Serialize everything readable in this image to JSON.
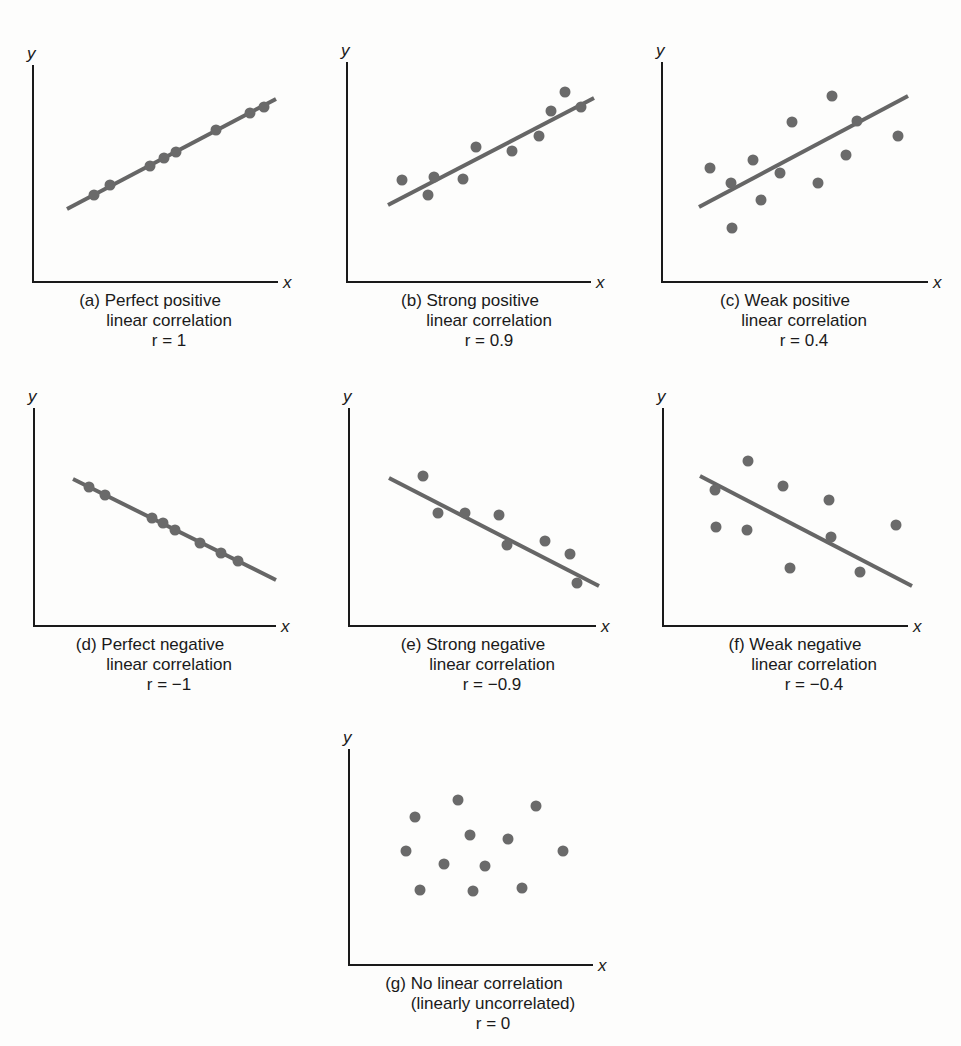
{
  "figure": {
    "axis_labels": {
      "x": "x",
      "y": "y"
    }
  },
  "colors": {
    "axis": "#1a1a1a",
    "fit_line": "#666666",
    "point": "#6a6a6a",
    "background": "#fdfdfc"
  },
  "chart_data": [
    {
      "id": "a",
      "type": "scatter",
      "label": "(a)",
      "caption": [
        "Perfect positive",
        "linear correlation"
      ],
      "r_text": "r = 1",
      "r": 1,
      "xlabel": "x",
      "ylabel": "y",
      "frame": {
        "x0": 33,
        "ytop": 65,
        "ybase": 282,
        "xend": 278
      },
      "fit_line": [
        [
          67,
          209
        ],
        [
          276,
          99
        ]
      ],
      "points": [
        [
          94,
          195
        ],
        [
          110,
          185
        ],
        [
          150,
          166
        ],
        [
          164,
          158
        ],
        [
          176,
          152
        ],
        [
          216,
          130
        ],
        [
          250,
          113
        ],
        [
          264,
          107
        ]
      ],
      "caption_x": 155
    },
    {
      "id": "b",
      "type": "scatter",
      "label": "(b)",
      "caption": [
        "Strong positive",
        "linear correlation"
      ],
      "r_text": "r = 0.9",
      "r": 0.9,
      "xlabel": "x",
      "ylabel": "y",
      "frame": {
        "x0": 347,
        "ytop": 62,
        "ybase": 282,
        "xend": 591
      },
      "fit_line": [
        [
          388,
          205
        ],
        [
          594,
          98
        ]
      ],
      "points": [
        [
          402,
          180
        ],
        [
          428,
          195
        ],
        [
          434,
          177
        ],
        [
          463,
          179
        ],
        [
          476,
          147
        ],
        [
          512,
          151
        ],
        [
          539,
          136
        ],
        [
          551,
          111
        ],
        [
          565,
          92
        ],
        [
          581,
          107
        ]
      ],
      "caption_x": 475
    },
    {
      "id": "c",
      "type": "scatter",
      "label": "(c)",
      "caption": [
        "Weak positive",
        "linear correlation"
      ],
      "r_text": "r = 0.4",
      "r": 0.4,
      "xlabel": "x",
      "ylabel": "y",
      "frame": {
        "x0": 662,
        "ytop": 62,
        "ybase": 282,
        "xend": 928
      },
      "fit_line": [
        [
          699,
          207
        ],
        [
          908,
          96
        ]
      ],
      "points": [
        [
          710,
          168
        ],
        [
          731,
          183
        ],
        [
          732,
          228
        ],
        [
          753,
          160
        ],
        [
          761,
          200
        ],
        [
          780,
          173
        ],
        [
          792,
          122
        ],
        [
          818,
          183
        ],
        [
          832,
          96
        ],
        [
          846,
          155
        ],
        [
          857,
          121
        ],
        [
          898,
          136
        ]
      ],
      "caption_x": 790
    },
    {
      "id": "d",
      "type": "scatter",
      "label": "(d)",
      "caption": [
        "Perfect negative",
        "linear correlation"
      ],
      "r_text": "r = −1",
      "r": -1,
      "xlabel": "x",
      "ylabel": "y",
      "frame": {
        "x0": 34,
        "ytop": 408,
        "ybase": 626,
        "xend": 276
      },
      "fit_line": [
        [
          73,
          479
        ],
        [
          276,
          580
        ]
      ],
      "points": [
        [
          89,
          487
        ],
        [
          105,
          495
        ],
        [
          152,
          518
        ],
        [
          163,
          523
        ],
        [
          175,
          530
        ],
        [
          200,
          543
        ],
        [
          221,
          553
        ],
        [
          238,
          561
        ]
      ],
      "caption_x": 155
    },
    {
      "id": "e",
      "type": "scatter",
      "label": "(e)",
      "caption": [
        "Strong negative",
        "linear correlation"
      ],
      "r_text": "r = −0.9",
      "r": -0.9,
      "xlabel": "x",
      "ylabel": "y",
      "frame": {
        "x0": 349,
        "ytop": 408,
        "ybase": 626,
        "xend": 596
      },
      "fit_line": [
        [
          389,
          478
        ],
        [
          599,
          586
        ]
      ],
      "points": [
        [
          423,
          476
        ],
        [
          438,
          513
        ],
        [
          465,
          513
        ],
        [
          499,
          515
        ],
        [
          507,
          545
        ],
        [
          545,
          541
        ],
        [
          570,
          554
        ],
        [
          577,
          583
        ]
      ],
      "caption_x": 478
    },
    {
      "id": "f",
      "type": "scatter",
      "label": "(f)",
      "caption": [
        "Weak negative",
        "linear correlation"
      ],
      "r_text": "r = −0.4",
      "r": -0.4,
      "xlabel": "x",
      "ylabel": "y",
      "frame": {
        "x0": 663,
        "ytop": 408,
        "ybase": 626,
        "xend": 908
      },
      "fit_line": [
        [
          700,
          476
        ],
        [
          912,
          586
        ]
      ],
      "points": [
        [
          715,
          490
        ],
        [
          716,
          527
        ],
        [
          748,
          461
        ],
        [
          747,
          530
        ],
        [
          783,
          486
        ],
        [
          790,
          568
        ],
        [
          829,
          500
        ],
        [
          831,
          537
        ],
        [
          860,
          572
        ],
        [
          896,
          525
        ]
      ],
      "caption_x": 800
    },
    {
      "id": "g",
      "type": "scatter",
      "label": "(g)",
      "caption": [
        "No linear correlation",
        "(linearly uncorrelated)"
      ],
      "r_text": "r = 0",
      "r": 0,
      "xlabel": "x",
      "ylabel": "y",
      "frame": {
        "x0": 349,
        "ytop": 749,
        "ybase": 965,
        "xend": 593
      },
      "fit_line": null,
      "points": [
        [
          415,
          817
        ],
        [
          406,
          851
        ],
        [
          458,
          800
        ],
        [
          470,
          835
        ],
        [
          444,
          864
        ],
        [
          485,
          866
        ],
        [
          420,
          890
        ],
        [
          473,
          891
        ],
        [
          508,
          839
        ],
        [
          536,
          806
        ],
        [
          563,
          851
        ],
        [
          522,
          888
        ]
      ],
      "caption_x": 479
    }
  ]
}
